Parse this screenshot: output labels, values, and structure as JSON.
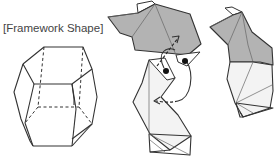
{
  "diagram": {
    "title_label": "[Framework Shape]",
    "figures": [
      {
        "id": "framework-polyhedron",
        "description": "wireframe polyhedron with hexagonal top/bottom faces, hidden edges dashed"
      },
      {
        "id": "folding-step",
        "description": "two folded paper pieces with curved fold arrows and two black dot markers"
      },
      {
        "id": "folded-result",
        "description": "assembled folded piece, shaded upper half, light lower half"
      }
    ],
    "colors": {
      "line": "#333333",
      "shaded_face": "#b3b3b3",
      "light_face": "#f3f3f3",
      "background": "#ffffff"
    }
  }
}
